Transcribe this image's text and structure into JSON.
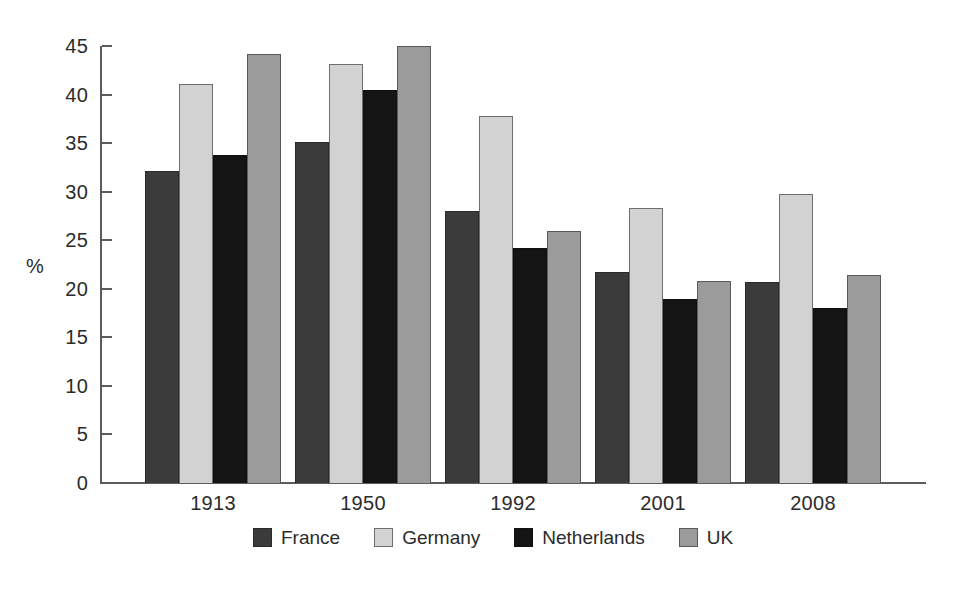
{
  "chart_data": {
    "type": "bar",
    "title": "",
    "subtitle": "",
    "xlabel": "",
    "ylabel": "%",
    "ylim": [
      0,
      45
    ],
    "ytick_step": 5,
    "yticks": [
      0,
      5,
      10,
      15,
      20,
      25,
      30,
      35,
      40,
      45
    ],
    "ytick_labels": [
      "0",
      "5",
      "10",
      "15",
      "20",
      "25",
      "30",
      "35",
      "40",
      "45"
    ],
    "grid": false,
    "legend_position": "bottom",
    "categories": [
      "1913",
      "1950",
      "1992",
      "2001",
      "2008"
    ],
    "series": [
      {
        "name": "France",
        "color": "#3b3b3b",
        "values": [
          32.1,
          35.1,
          28.0,
          21.7,
          20.7
        ]
      },
      {
        "name": "Germany",
        "color": "#d2d2d2",
        "values": [
          41.1,
          43.1,
          37.8,
          28.3,
          29.8
        ]
      },
      {
        "name": "Netherlands",
        "color": "#141414",
        "values": [
          33.8,
          40.5,
          24.2,
          19.0,
          18.0
        ]
      },
      {
        "name": "UK",
        "color": "#9b9b9b",
        "values": [
          44.2,
          45.0,
          25.9,
          20.8,
          21.4
        ]
      }
    ],
    "legend": [
      {
        "label": "France",
        "color": "#3b3b3b"
      },
      {
        "label": "Germany",
        "color": "#d2d2d2"
      },
      {
        "label": "Netherlands",
        "color": "#141414"
      },
      {
        "label": "UK",
        "color": "#9b9b9b"
      }
    ]
  },
  "axis": {
    "unit_label": "%"
  },
  "colors": {
    "axis": "#5c5c5c",
    "text": "#2b2b2b",
    "background": "#ffffff"
  }
}
